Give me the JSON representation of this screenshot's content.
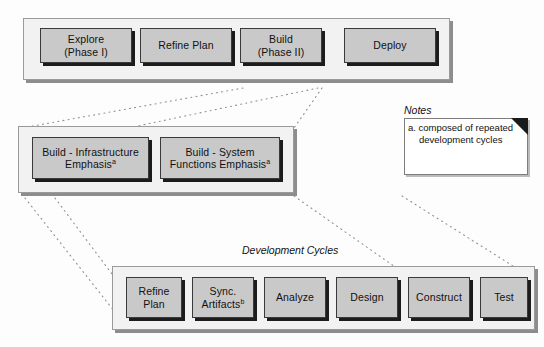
{
  "diagram": {
    "type": "process-flow",
    "phases_row": {
      "name": "top-level-phases",
      "boxes": [
        {
          "id": "explore",
          "lines": [
            "Explore",
            "(Phase I)"
          ]
        },
        {
          "id": "refine-plan",
          "lines": [
            "Refine Plan"
          ]
        },
        {
          "id": "build",
          "lines": [
            "Build",
            "(Phase II)"
          ]
        },
        {
          "id": "deploy",
          "lines": [
            "Deploy"
          ]
        }
      ]
    },
    "build_row": {
      "name": "build-breakdown",
      "boxes": [
        {
          "id": "build-infrastructure",
          "lines": [
            "Build - Infrastructure",
            "Emphasis"
          ],
          "superscript": "a"
        },
        {
          "id": "build-system-functions",
          "lines": [
            "Build - System",
            "Functions Emphasis"
          ],
          "superscript": "a"
        }
      ]
    },
    "cycles_row": {
      "name": "development-cycles",
      "caption": "Development Cycles",
      "boxes": [
        {
          "id": "refine-plan-cycle",
          "lines": [
            "Refine",
            "Plan"
          ],
          "superscript": ""
        },
        {
          "id": "sync-artifacts",
          "lines": [
            "Sync.",
            "Artifacts"
          ],
          "superscript": "b"
        },
        {
          "id": "analyze",
          "lines": [
            "Analyze"
          ],
          "superscript": ""
        },
        {
          "id": "design",
          "lines": [
            "Design"
          ],
          "superscript": ""
        },
        {
          "id": "construct",
          "lines": [
            "Construct"
          ],
          "superscript": ""
        },
        {
          "id": "test",
          "lines": [
            "Test"
          ],
          "superscript": ""
        }
      ]
    },
    "notes": {
      "title": "Notes",
      "items": [
        "a. composed of repeated  development cycles"
      ]
    },
    "colors": {
      "box_fill": "#c9c9c9",
      "box_border": "#3a3a3a",
      "container_fill": "#f2f2f2",
      "container_border": "#9a9a9a",
      "connector": "#8f8f8f",
      "note_fill": "#ffffff"
    }
  }
}
